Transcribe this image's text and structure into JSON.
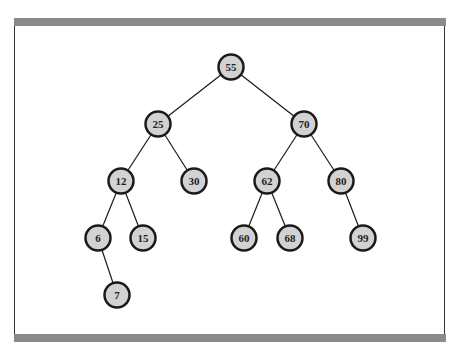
{
  "diagram": {
    "type": "binary-search-tree",
    "nodes": [
      {
        "id": "n55",
        "label": "55"
      },
      {
        "id": "n25",
        "label": "25"
      },
      {
        "id": "n70",
        "label": "70"
      },
      {
        "id": "n12",
        "label": "12"
      },
      {
        "id": "n30",
        "label": "30"
      },
      {
        "id": "n62",
        "label": "62"
      },
      {
        "id": "n80",
        "label": "80"
      },
      {
        "id": "n6",
        "label": "6"
      },
      {
        "id": "n15",
        "label": "15"
      },
      {
        "id": "n60",
        "label": "60"
      },
      {
        "id": "n68",
        "label": "68"
      },
      {
        "id": "n99",
        "label": "99"
      },
      {
        "id": "n7",
        "label": "7"
      }
    ],
    "edges": [
      {
        "from": "n55",
        "to": "n25"
      },
      {
        "from": "n55",
        "to": "n70"
      },
      {
        "from": "n25",
        "to": "n12"
      },
      {
        "from": "n25",
        "to": "n30"
      },
      {
        "from": "n70",
        "to": "n62"
      },
      {
        "from": "n70",
        "to": "n80"
      },
      {
        "from": "n12",
        "to": "n6"
      },
      {
        "from": "n12",
        "to": "n15"
      },
      {
        "from": "n62",
        "to": "n60"
      },
      {
        "from": "n62",
        "to": "n68"
      },
      {
        "from": "n80",
        "to": "n99"
      },
      {
        "from": "n6",
        "to": "n7"
      }
    ],
    "colors": {
      "node_fill": "#d2d2d2",
      "node_stroke": "#1a1a1a",
      "frame_bar": "#8a8a8a"
    }
  }
}
